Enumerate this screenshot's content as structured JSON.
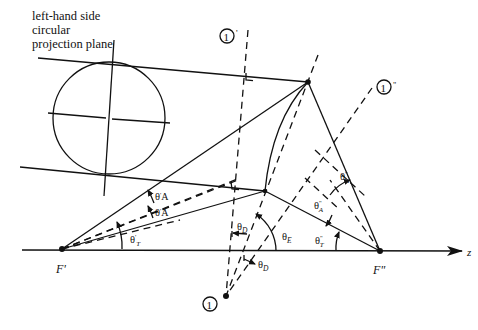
{
  "title_lines": [
    "left-hand side",
    "circular",
    "projection plane"
  ],
  "points": {
    "F_prime": "F'",
    "F_double_prime": "F\"",
    "axis": "z"
  },
  "markers": {
    "m1": "1",
    "m1_prime_suffix": "'",
    "m1_double_prime_suffix": "\""
  },
  "angles": {
    "theta_T_prime": {
      "base": "θ",
      "sub": "T",
      "sup": "'"
    },
    "theta_A_prime_1": {
      "base": "θ",
      "sub": "A",
      "sup": "'"
    },
    "theta_A_prime_2": {
      "base": "θ",
      "sub": "A",
      "sup": "'"
    },
    "theta_D_1": {
      "base": "θ",
      "sub": "D"
    },
    "theta_D_2": {
      "base": "θ",
      "sub": "D"
    },
    "theta_E": {
      "base": "θ",
      "sub": "E"
    },
    "theta_A_dprime_1": {
      "base": "θ",
      "sub": "A",
      "sup": "\""
    },
    "theta_A_dprime_2": {
      "base": "θ",
      "sub": "A",
      "sup": "\""
    },
    "theta_T_dprime": {
      "base": "θ",
      "sub": "T",
      "sup": "\""
    }
  },
  "colors": {
    "ink": "#111111",
    "background": "#ffffff"
  }
}
